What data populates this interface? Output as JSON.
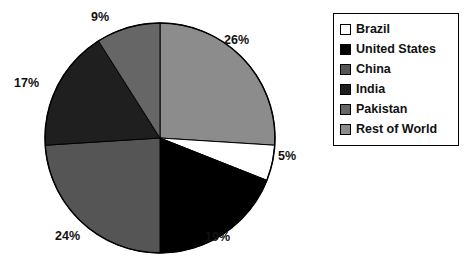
{
  "chart_data": {
    "type": "pie",
    "title": "",
    "legend_position": "right",
    "categories": [
      "Brazil",
      "United States",
      "China",
      "India",
      "Pakistan",
      "Rest of World"
    ],
    "values": [
      5,
      19,
      24,
      17,
      9,
      26
    ],
    "value_labels": [
      "5%",
      "19%",
      "24%",
      "17%",
      "9%",
      "26%"
    ],
    "colors": [
      "#ffffff",
      "#000000",
      "#555555",
      "#1f1f1f",
      "#666666",
      "#8c8c8c"
    ],
    "slice_border_color": "#000000",
    "start_angle_deg": 0,
    "direction": "clockwise",
    "slices": [
      {
        "label": "Rest of World",
        "value": 26,
        "value_label": "26%",
        "color": "#8c8c8c"
      },
      {
        "label": "Brazil",
        "value": 5,
        "value_label": "5%",
        "color": "#ffffff"
      },
      {
        "label": "United States",
        "value": 19,
        "value_label": "19%",
        "color": "#000000"
      },
      {
        "label": "China",
        "value": 24,
        "value_label": "24%",
        "color": "#555555"
      },
      {
        "label": "India",
        "value": 17,
        "value_label": "17%",
        "color": "#1f1f1f"
      },
      {
        "label": "Pakistan",
        "value": 9,
        "value_label": "9%",
        "color": "#666666"
      }
    ]
  },
  "legend": {
    "items": [
      {
        "label": "Brazil",
        "color": "#ffffff"
      },
      {
        "label": "United States",
        "color": "#000000"
      },
      {
        "label": "China",
        "color": "#555555"
      },
      {
        "label": "India",
        "color": "#1f1f1f"
      },
      {
        "label": "Pakistan",
        "color": "#666666"
      },
      {
        "label": "Rest of World",
        "color": "#8c8c8c"
      }
    ]
  },
  "labels": {
    "pct_26": "26%",
    "pct_5": "5%",
    "pct_19": "19%",
    "pct_24": "24%",
    "pct_17": "17%",
    "pct_9": "9%"
  }
}
